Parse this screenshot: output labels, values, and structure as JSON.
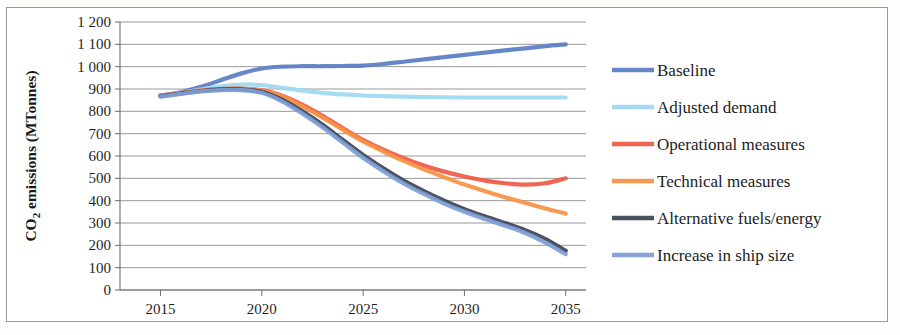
{
  "chart_data": {
    "type": "line",
    "title": "",
    "xlabel": "",
    "ylabel": "CO2 emissions (MTonnes)",
    "ylabel_rich": {
      "prefix": "CO",
      "sub": "2",
      "suffix": " emissions (MTonnes)"
    },
    "xlim": [
      2013,
      2036
    ],
    "ylim": [
      0,
      1200
    ],
    "y_tick_step": 100,
    "grid": true,
    "legend_position": "right",
    "x_tick_labels": [
      "2015",
      "2020",
      "2025",
      "2030",
      "2035"
    ],
    "x_tick_values": [
      2015,
      2020,
      2025,
      2030,
      2035
    ],
    "y_tick_labels": [
      "1 200",
      "1 100",
      "1 000",
      "900",
      "800",
      "700",
      "600",
      "500",
      "400",
      "300",
      "200",
      "100",
      "0"
    ],
    "y_tick_values": [
      1200,
      1100,
      1000,
      900,
      800,
      700,
      600,
      500,
      400,
      300,
      200,
      100,
      0
    ],
    "x": [
      2015,
      2016,
      2017,
      2018,
      2019,
      2020,
      2021,
      2022,
      2023,
      2024,
      2025,
      2026,
      2027,
      2028,
      2029,
      2030,
      2031,
      2032,
      2033,
      2034,
      2035
    ],
    "series": [
      {
        "name": "Baseline",
        "color": "#5b7fc4",
        "values": [
          870,
          885,
          910,
          940,
          970,
          992,
          1000,
          1002,
          1002,
          1003,
          1005,
          1012,
          1022,
          1033,
          1043,
          1053,
          1063,
          1073,
          1082,
          1092,
          1100
        ]
      },
      {
        "name": "Adjusted demand",
        "color": "#9fd9f2",
        "values": [
          870,
          883,
          898,
          912,
          920,
          918,
          905,
          893,
          883,
          876,
          871,
          868,
          866,
          864,
          863,
          862,
          862,
          862,
          862,
          862,
          862
        ]
      },
      {
        "name": "Operational measures",
        "color": "#f05a46",
        "values": [
          870,
          882,
          893,
          900,
          901,
          895,
          870,
          830,
          780,
          725,
          672,
          628,
          590,
          557,
          530,
          508,
          490,
          478,
          472,
          478,
          500
        ]
      },
      {
        "name": "Technical measures",
        "color": "#f79246",
        "values": [
          870,
          882,
          893,
          900,
          901,
          893,
          865,
          822,
          772,
          718,
          665,
          620,
          578,
          540,
          505,
          472,
          443,
          415,
          390,
          365,
          342
        ]
      },
      {
        "name": "Alternative fuels/energy",
        "color": "#3e4553",
        "values": [
          868,
          880,
          891,
          898,
          898,
          888,
          852,
          800,
          740,
          672,
          605,
          545,
          490,
          443,
          400,
          362,
          330,
          300,
          268,
          228,
          175
        ]
      },
      {
        "name": "Increase in ship size",
        "color": "#7d9ed6",
        "values": [
          866,
          878,
          889,
          895,
          895,
          883,
          845,
          790,
          728,
          660,
          592,
          532,
          477,
          430,
          387,
          350,
          318,
          288,
          255,
          212,
          160
        ]
      }
    ]
  },
  "legend": {
    "items": [
      {
        "label": "Baseline",
        "color": "#5b7fc4"
      },
      {
        "label": "Adjusted demand",
        "color": "#9fd9f2"
      },
      {
        "label": "Operational measures",
        "color": "#f05a46"
      },
      {
        "label": "Technical measures",
        "color": "#f79246"
      },
      {
        "label": "Alternative fuels/energy",
        "color": "#3e4553"
      },
      {
        "label": "Increase in ship size",
        "color": "#7d9ed6"
      }
    ]
  }
}
